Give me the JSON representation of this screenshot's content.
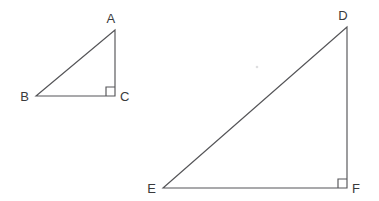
{
  "figure": {
    "background_color": "#ffffff",
    "line_color": "#555558",
    "label_color": "#3a3a3c"
  },
  "triangles": [
    {
      "id": "abc",
      "name": "triangle-abc",
      "size": "small",
      "right_angle_vertex": "C",
      "vertices": [
        {
          "label": "A",
          "x": 115,
          "y": 30,
          "label_x": 111,
          "label_y": 23,
          "anchor": "middle"
        },
        {
          "label": "B",
          "x": 36,
          "y": 96,
          "label_x": 29,
          "label_y": 101,
          "anchor": "end"
        },
        {
          "label": "C",
          "x": 115,
          "y": 96,
          "label_x": 120,
          "label_y": 101,
          "anchor": "start"
        }
      ],
      "path": "M 115 30 L 36 96 L 115 96 Z",
      "right_angle_mark_path": "M 106 96 L 106 87 L 115 87",
      "leg_horizontal_px": 79,
      "leg_vertical_px": 66
    },
    {
      "id": "def",
      "name": "triangle-def",
      "size": "large",
      "right_angle_vertex": "F",
      "vertices": [
        {
          "label": "D",
          "x": 347,
          "y": 27,
          "label_x": 343,
          "label_y": 20,
          "anchor": "middle"
        },
        {
          "label": "E",
          "x": 163,
          "y": 188,
          "label_x": 156,
          "label_y": 193,
          "anchor": "end"
        },
        {
          "label": "F",
          "x": 347,
          "y": 188,
          "label_x": 352,
          "label_y": 193,
          "anchor": "start"
        }
      ],
      "path": "M 347 27 L 163 188 L 347 188 Z",
      "right_angle_mark_path": "M 338 188 L 338 179 L 347 179",
      "leg_horizontal_px": 184,
      "leg_vertical_px": 161
    }
  ],
  "artifacts": [
    {
      "name": "scan-speck",
      "x": 257,
      "y": 67,
      "r": 1.3
    }
  ]
}
